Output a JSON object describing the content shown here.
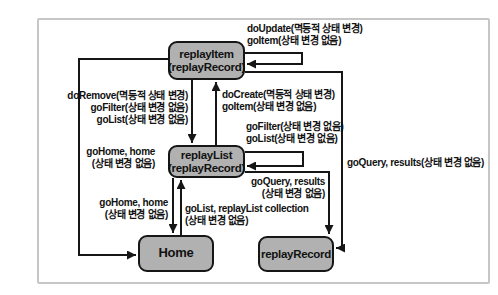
{
  "diagram": {
    "states": {
      "replayItem": {
        "name": "replayItem",
        "sub": "(replayRecord)"
      },
      "replayList": {
        "name": "replayList",
        "sub": "(replayRecord)"
      },
      "home": {
        "name": "Home"
      },
      "replayRecord": {
        "name": "replayRecord"
      }
    },
    "edge_labels": {
      "item_self": {
        "l1": "doUpdate(멱등적 상태 변경)",
        "l2": "goItem(상태 변경 없음)"
      },
      "item_to_list": {
        "l1": "doRemove(멱등적 상태 변경)",
        "l2": "goFilter(상태 변경 없음)",
        "l3": "goList(상태 변경 없음)"
      },
      "list_to_item": {
        "l1": "doCreate(멱등적 상태 변경)",
        "l2": "goItem(상태 변경 없음)"
      },
      "list_self": {
        "l1": "goFilter(상태 변경 없음)",
        "l2": "goList(상태 변경 없음)"
      },
      "item_to_home": {
        "l1": "goHome, home",
        "l2": "(상태 변경 없음)"
      },
      "list_to_home": {
        "l1": "goHome, home",
        "l2": "(상태 변경 없음)"
      },
      "home_to_list": {
        "l1": "goList, replayList collection",
        "l2": "(상태 변경 없음)"
      },
      "list_to_record": {
        "l1": "goQuery, results",
        "l2": "(상태 변경 없음)"
      },
      "item_to_record": {
        "l1": "goQuery, results(상태 변경 없음)"
      }
    },
    "colors": {
      "state_fill": "#b1b1b1",
      "state_border": "#161616",
      "arrow": "#161616",
      "frame_border": "#c6c6c6",
      "background": "#ffffff",
      "text": "#111111"
    }
  }
}
